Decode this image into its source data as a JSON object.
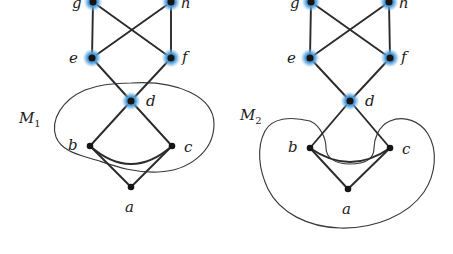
{
  "figure": {
    "kind": "graph-diagram-pair",
    "background_color": "#ffffff",
    "vertex_fill": "#151515",
    "edge_color": "#2b2b2b",
    "highlight_color": "#3e93d6",
    "highlight_color_outer": "#8dc4ea",
    "region_stroke": "#3a3a3a"
  },
  "diagrams": [
    {
      "id": "M1",
      "region_label": "M",
      "region_subscript": "1",
      "region_label_pos": {
        "x": 20,
        "y": 112
      },
      "region_contains": [
        "b",
        "c",
        "d"
      ],
      "vertices": [
        {
          "id": "g",
          "label": "g",
          "x": 93,
          "y": 2,
          "highlighted": true,
          "label_x": 72,
          "label_y": -4
        },
        {
          "id": "h",
          "label": "h",
          "x": 171,
          "y": 2,
          "highlighted": true,
          "label_x": 181,
          "label_y": -4
        },
        {
          "id": "e",
          "label": "e",
          "x": 92,
          "y": 58,
          "highlighted": true,
          "label_x": 69,
          "label_y": 52
        },
        {
          "id": "f",
          "label": "f",
          "x": 171,
          "y": 58,
          "highlighted": true,
          "label_x": 182,
          "label_y": 51
        },
        {
          "id": "d",
          "label": "d",
          "x": 131,
          "y": 101,
          "highlighted": true,
          "label_x": 146,
          "label_y": 96
        },
        {
          "id": "b",
          "label": "b",
          "x": 90,
          "y": 146,
          "highlighted": false,
          "label_x": 68,
          "label_y": 139
        },
        {
          "id": "c",
          "label": "c",
          "x": 172,
          "y": 146,
          "highlighted": false,
          "label_x": 184,
          "label_y": 140
        },
        {
          "id": "a",
          "label": "a",
          "x": 131,
          "y": 187,
          "highlighted": false,
          "label_x": 124,
          "label_y": 202
        }
      ],
      "edges": [
        {
          "from": "g",
          "to": "e"
        },
        {
          "from": "g",
          "to": "f"
        },
        {
          "from": "h",
          "to": "e"
        },
        {
          "from": "h",
          "to": "f"
        },
        {
          "from": "e",
          "to": "d"
        },
        {
          "from": "f",
          "to": "d"
        },
        {
          "from": "d",
          "to": "b"
        },
        {
          "from": "d",
          "to": "c"
        },
        {
          "from": "b",
          "to": "a"
        },
        {
          "from": "c",
          "to": "a"
        }
      ],
      "curved_edges": [
        {
          "from": "b",
          "to": "c",
          "note": "arc bulging downward between b and c"
        }
      ]
    },
    {
      "id": "M2",
      "region_label": "M",
      "region_subscript": "2",
      "region_label_pos": {
        "x": 241,
        "y": 109
      },
      "region_contains": [
        "b",
        "c",
        "a"
      ],
      "vertices": [
        {
          "id": "g",
          "label": "g",
          "x": 311,
          "y": 2,
          "highlighted": true,
          "label_x": 290,
          "label_y": -4
        },
        {
          "id": "h",
          "label": "h",
          "x": 389,
          "y": 2,
          "highlighted": true,
          "label_x": 399,
          "label_y": -4
        },
        {
          "id": "e",
          "label": "e",
          "x": 310,
          "y": 58,
          "highlighted": true,
          "label_x": 287,
          "label_y": 52
        },
        {
          "id": "f",
          "label": "f",
          "x": 390,
          "y": 58,
          "highlighted": true,
          "label_x": 401,
          "label_y": 51
        },
        {
          "id": "d",
          "label": "d",
          "x": 350,
          "y": 101,
          "highlighted": true,
          "label_x": 365,
          "label_y": 96
        },
        {
          "id": "b",
          "label": "b",
          "x": 310,
          "y": 148,
          "highlighted": false,
          "label_x": 288,
          "label_y": 141
        },
        {
          "id": "c",
          "label": "c",
          "x": 390,
          "y": 148,
          "highlighted": false,
          "label_x": 402,
          "label_y": 142
        },
        {
          "id": "a",
          "label": "a",
          "x": 348,
          "y": 189,
          "highlighted": false,
          "label_x": 341,
          "label_y": 204
        }
      ],
      "edges": [
        {
          "from": "g",
          "to": "e"
        },
        {
          "from": "g",
          "to": "f"
        },
        {
          "from": "h",
          "to": "e"
        },
        {
          "from": "h",
          "to": "f"
        },
        {
          "from": "e",
          "to": "d"
        },
        {
          "from": "f",
          "to": "d"
        },
        {
          "from": "d",
          "to": "b"
        },
        {
          "from": "d",
          "to": "c"
        },
        {
          "from": "b",
          "to": "a"
        },
        {
          "from": "c",
          "to": "a"
        }
      ],
      "curved_edges": [
        {
          "from": "b",
          "to": "c",
          "note": "arc bulging downward between b and c"
        }
      ]
    }
  ],
  "labels": {
    "m1": "M",
    "m1_sub": "1",
    "m2": "M",
    "m2_sub": "2",
    "g": "g",
    "h": "h",
    "e": "e",
    "f": "f",
    "d": "d",
    "b": "b",
    "c": "c",
    "a": "a"
  }
}
